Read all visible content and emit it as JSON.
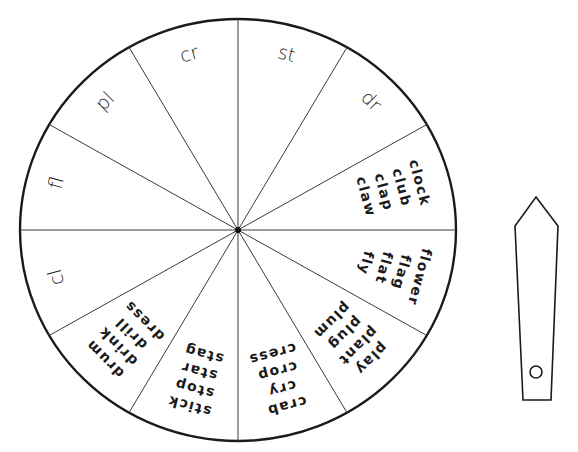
{
  "wheel": {
    "center": [
      238,
      230
    ],
    "radius_x": 218,
    "radius_y": 211,
    "segment_count": 12,
    "colors": {
      "outline": "#1a1a1a",
      "spokes": "#3a3a3a",
      "background": "#ffffff"
    },
    "segments": [
      {
        "index": 0,
        "type": "prefix",
        "label": "st"
      },
      {
        "index": 1,
        "type": "prefix",
        "label": "dr"
      },
      {
        "index": 2,
        "type": "words",
        "words": [
          "clock",
          "club",
          "clap",
          "claw"
        ]
      },
      {
        "index": 3,
        "type": "words",
        "words": [
          "flower",
          "flag",
          "flat",
          "fly"
        ]
      },
      {
        "index": 4,
        "type": "words",
        "words": [
          "play",
          "plant",
          "plug",
          "plum"
        ]
      },
      {
        "index": 5,
        "type": "words",
        "words": [
          "crab",
          "cry",
          "crop",
          "cress"
        ]
      },
      {
        "index": 6,
        "type": "words",
        "words": [
          "stick",
          "stop",
          "star",
          "stag"
        ]
      },
      {
        "index": 7,
        "type": "words",
        "words": [
          "drum",
          "drink",
          "drill",
          "dress"
        ]
      },
      {
        "index": 8,
        "type": "prefix",
        "label": "cl"
      },
      {
        "index": 9,
        "type": "prefix",
        "label": "fl"
      },
      {
        "index": 10,
        "type": "prefix",
        "label": "pl"
      },
      {
        "index": 11,
        "type": "prefix",
        "label": "cr"
      }
    ]
  },
  "pointer": {
    "points": [
      [
        536,
        197
      ],
      [
        558,
        226
      ],
      [
        551,
        400
      ],
      [
        523,
        400
      ],
      [
        515,
        226
      ]
    ],
    "hole": {
      "cx": 536,
      "cy": 372,
      "r": 6
    }
  }
}
